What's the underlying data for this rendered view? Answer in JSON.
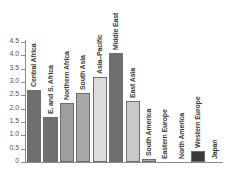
{
  "chart_data": {
    "type": "bar",
    "title": "",
    "subtitle": "",
    "xlabel": "",
    "ylabel": "",
    "ylim": [
      0,
      4.5
    ],
    "grid": false,
    "legend": "none",
    "orientation": "vertical",
    "bar_labels_rotated": true,
    "y_ticks": [
      "0",
      "0.5",
      "1.0",
      "1.5",
      "2.0",
      "2.5",
      "3.0",
      "3.5",
      "4.0",
      "4.5"
    ],
    "y_tick_values": [
      0,
      0.5,
      1.0,
      1.5,
      2.0,
      2.5,
      3.0,
      3.5,
      4.0,
      4.5
    ],
    "categories": [
      "Central Africa",
      "E. and S. Africa",
      "Northern Africa",
      "South Asia",
      "Asia–Pacific",
      "Middle East",
      "East Asia",
      "South America",
      "Eastern Europe",
      "North America",
      "Western Europe",
      "Japan"
    ],
    "values": [
      2.7,
      1.7,
      2.2,
      2.6,
      3.2,
      4.1,
      2.3,
      0.1,
      0.0,
      0.0,
      0.4,
      0.0
    ],
    "bar_colors": [
      "#6f6f6f",
      "#6f6f6f",
      "#9e9e9e",
      "#a8a8a8",
      "#dcdcdc",
      "#6f6f6f",
      "#c9c9c9",
      "#a8a8a8",
      "#a8a8a8",
      "#a8a8a8",
      "#3a3a3a",
      "#a8a8a8"
    ],
    "axis_color": "#8a8a8a",
    "bar_border_color": "#6e6e6e",
    "background_color": "#ffffff",
    "label_color": "#3a3a3a",
    "tick_label_color": "#555555"
  }
}
